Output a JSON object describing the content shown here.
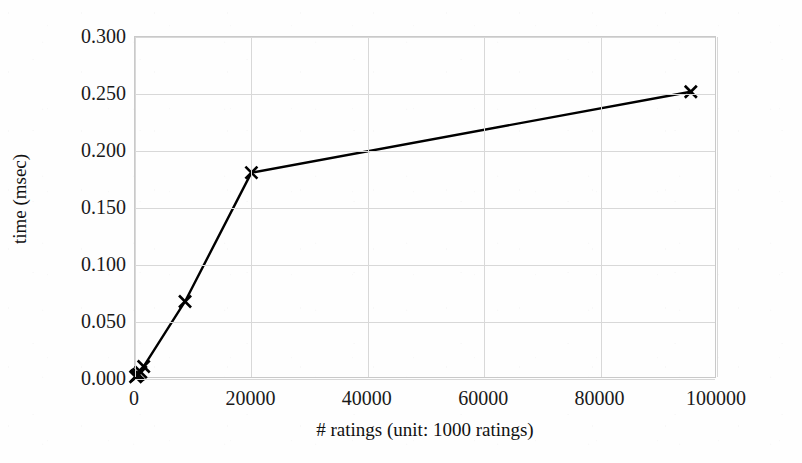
{
  "chart_data": {
    "type": "line",
    "title": "",
    "xlabel": "# ratings (unit: 1000 ratings)",
    "ylabel": "time (msec)",
    "xlim": [
      0,
      100000
    ],
    "ylim": [
      0.0,
      0.3
    ],
    "grid": true,
    "legend": false,
    "marker": "x",
    "line_color": "#000000",
    "grid_color": "#d8d8d8",
    "axis_color": "#c9c9c9",
    "xticks": [
      0,
      20000,
      40000,
      60000,
      80000,
      100000
    ],
    "xtick_labels": [
      "0",
      "20000",
      "40000",
      "60000",
      "80000",
      "100000"
    ],
    "yticks": [
      0.0,
      0.05,
      0.1,
      0.15,
      0.2,
      0.25,
      0.3
    ],
    "ytick_labels": [
      "0.000",
      "0.050",
      "0.100",
      "0.150",
      "0.200",
      "0.250",
      "0.300"
    ],
    "series": [
      {
        "name": "time",
        "x": [
          100,
          300,
          600,
          1000,
          1500,
          8600,
          20000,
          95500
        ],
        "y": [
          0.002,
          0.003,
          0.004,
          0.006,
          0.011,
          0.068,
          0.181,
          0.252
        ]
      }
    ]
  }
}
